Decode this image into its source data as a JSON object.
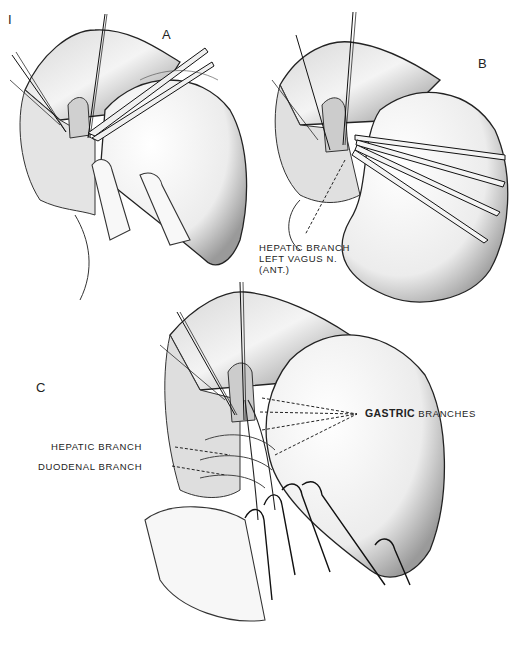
{
  "figure": {
    "figure_number": "I",
    "panels": [
      {
        "id": "A",
        "label": "A"
      },
      {
        "id": "B",
        "label": "B"
      },
      {
        "id": "C",
        "label": "C"
      }
    ],
    "annotations": {
      "panel_b": {
        "line1": "HEPATIC BRANCH",
        "line2": "LEFT VAGUS N.",
        "line3": "(ANT.)"
      },
      "panel_c": {
        "hepatic": "HEPATIC BRANCH",
        "duodenal": "DUODENAL BRANCH",
        "gastric_bold": "GASTRIC",
        "gastric_rest": "BRANCHES"
      }
    },
    "colors": {
      "background": "#ffffff",
      "ink": "#1a1a1a",
      "shade": "#6b6b6b"
    }
  }
}
